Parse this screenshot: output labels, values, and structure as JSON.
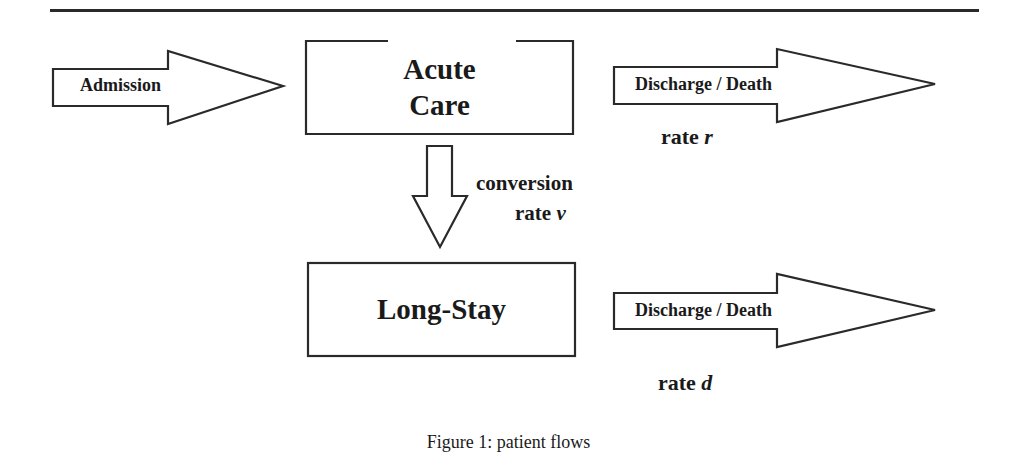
{
  "figure": {
    "caption": "Figure 1: patient flows",
    "nodes": {
      "acute_care": {
        "line1": "Acute",
        "line2": "Care"
      },
      "long_stay": {
        "label": "Long-Stay"
      }
    },
    "arrows": {
      "admission": {
        "label": "Admission"
      },
      "acute_discharge": {
        "label": "Discharge / Death",
        "rate_word": "rate",
        "rate_symbol": "r"
      },
      "conversion": {
        "line1": "conversion",
        "rate_word": "rate",
        "rate_symbol": "v"
      },
      "longstay_discharge": {
        "label": "Discharge / Death",
        "rate_word": "rate",
        "rate_symbol": "d"
      }
    }
  }
}
